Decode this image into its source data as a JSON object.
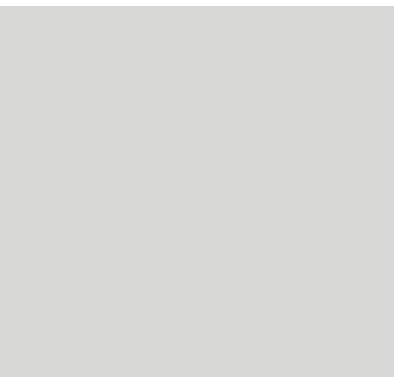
{
  "figure": {
    "background_color": "#d8d8d6",
    "top_strip_color": "#ffffff"
  },
  "chart_data": {
    "type": "line",
    "title": "",
    "xlabel": "year",
    "ylabel": "number of individuals",
    "xlim": [
      1975,
      2015
    ],
    "ylim": [
      0,
      1300
    ],
    "x_ticks": [
      1975,
      1980,
      1985,
      1990,
      1995,
      2000,
      2005,
      2010,
      2015
    ],
    "y_ticks": [
      0,
      100,
      200,
      300,
      400,
      500,
      600,
      700,
      800,
      900,
      1000,
      1100,
      1200,
      1300
    ],
    "x_grid_step": 5,
    "y_grid_step": 50,
    "grid": true,
    "legend": "none",
    "series": [
      {
        "name": "population-x-markers",
        "marker": "x",
        "line_color": "#262626",
        "marker_color": "#1c1c1c",
        "points": [
          [
            1980,
            160
          ],
          [
            2003,
            750
          ],
          [
            2012,
            1250
          ]
        ]
      },
      {
        "name": "population-square-markers",
        "marker": "square",
        "line_color": "#6e6e6e",
        "marker_color": "#161616",
        "points": [
          [
            1980,
            50
          ],
          [
            1993,
            50
          ],
          [
            2003,
            150
          ],
          [
            2012,
            350
          ]
        ]
      }
    ],
    "annotation": {
      "line1": "In 1979, Hurricane David destroyed",
      "line2": "42% of rainforest",
      "event_year": 1979,
      "line_style": "dashed",
      "line_color": "#141414",
      "box_color": "#ffffff"
    },
    "colors": {
      "grid": "#a2a2a0",
      "axis": "#3a3a3a",
      "tick_text": "#4f4f4f"
    }
  }
}
